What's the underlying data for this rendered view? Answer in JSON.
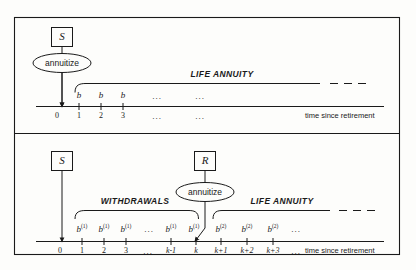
{
  "figure": {
    "title_hidden": "",
    "background_color": "#fdfdfb",
    "line_color": "#1a1a1a",
    "frame": {
      "x": 14,
      "y": 17,
      "width": 386,
      "height": 238
    }
  },
  "panels": [
    {
      "id": "panel-top",
      "name": "immediate-life-annuity",
      "source_box": {
        "label": "S"
      },
      "decision": {
        "label": "annuitize"
      },
      "bracket_label": "LIFE ANNUITY",
      "axis_caption": "time since retirement",
      "payments": [
        {
          "symbol": "b",
          "sup": ""
        },
        {
          "symbol": "b",
          "sup": ""
        },
        {
          "symbol": "b",
          "sup": ""
        }
      ],
      "payment_ellipsis": [
        "...",
        "..."
      ],
      "ticks": [
        "0",
        "1",
        "2",
        "3"
      ],
      "tick_ellipsis": [
        "...",
        "..."
      ]
    },
    {
      "id": "panel-bottom",
      "name": "deferred-life-annuity",
      "source_box": {
        "label": "S"
      },
      "reserve_box": {
        "label": "R"
      },
      "decision": {
        "label": "annuitize"
      },
      "bracket_label_left": "WITHDRAWALS",
      "bracket_label_right": "LIFE ANNUITY",
      "axis_caption": "time since retirement",
      "payments_phase1": [
        {
          "symbol": "b",
          "sup": "(1)"
        },
        {
          "symbol": "b",
          "sup": "(1)"
        },
        {
          "symbol": "b",
          "sup": "(1)"
        },
        {
          "symbol": "b",
          "sup": "(1)"
        },
        {
          "symbol": "b",
          "sup": "(1)"
        }
      ],
      "payments_phase1_ellipsis": "...",
      "payments_phase2": [
        {
          "symbol": "b",
          "sup": "(2)"
        },
        {
          "symbol": "b",
          "sup": "(2)"
        },
        {
          "symbol": "b",
          "sup": "(2)"
        }
      ],
      "payments_phase2_ellipsis": "...",
      "ticks_phase1": [
        "0",
        "1",
        "2",
        "3"
      ],
      "ticks_phase1_ellipsis": "...",
      "ticks_k": [
        "k-1",
        "k"
      ],
      "ticks_phase2": [
        "k+1",
        "k+2",
        "k+3"
      ],
      "ticks_phase2_ellipsis": "..."
    }
  ]
}
